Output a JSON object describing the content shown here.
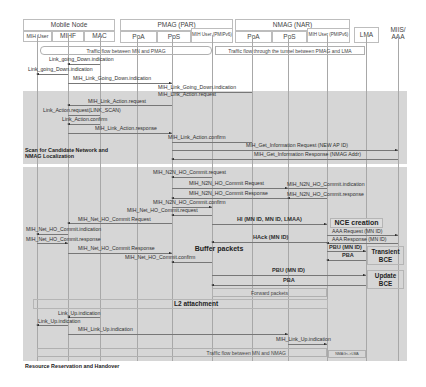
{
  "diagram": {
    "type": "message-sequence-chart",
    "header": {
      "groups": [
        {
          "label": "Mobile Node"
        },
        {
          "label": "PMAG (PAR)"
        },
        {
          "label": "NMAG (NAR)"
        }
      ],
      "entities": [
        {
          "label": "MIH User"
        },
        {
          "label": "MIHF"
        },
        {
          "label": "MAC"
        },
        {
          "label": "PoA"
        },
        {
          "label": "PoS"
        },
        {
          "label": "MIH User (PMIPv6)"
        },
        {
          "label": "PoA"
        },
        {
          "label": "PoS"
        },
        {
          "label": "MIH User (PMIPv6)"
        },
        {
          "label": "LMA"
        },
        {
          "label": "MIIS/ AAA"
        }
      ]
    },
    "flows": {
      "top_left": "Traffic flow between MN and PMAG",
      "top_right": "Traffic flow through the tunnel between PMAG and LMA",
      "forward": "Forward packets",
      "bottom": "Traffic flow between MN and NMAG",
      "bottom_right": "NMAG<->LMA"
    },
    "phases": [
      {
        "label": "Scan for Candidate Network and NMAG Localization"
      },
      {
        "label": "Resource Reservation and Handover"
      }
    ],
    "messages": [
      "Link_going_Down.indication",
      "Link_going_Down.indication",
      "MIH_Link_Going_Down.indication",
      "MIH_Link_Going_Down.indication",
      "MIH_Link_Action.request",
      "MIH_Link_Action.request",
      "Link_Action.request(LINK_SCAN)",
      "Link_Action.confirm",
      "MIH_Link_Action.response",
      "MIH_Link_Action.confirm",
      "MIH_Get_Information Request (NEW AP ID)",
      "MIH_Get_Information Response (NMAG Addr)",
      "MIH_N2N_HO_Commit.request",
      "MIH_N2N_HO_Commit Request",
      "MIH_N2N_HO_Commit.indication",
      "MIH_N2N_HO_Commit Response",
      "MIH_N2N_HO_Commit.response",
      "MIH_N2N_HO_Commit.confirm",
      "MIH_Net_HO_Commit.request",
      "MIH_Net_HO_Commit Request",
      "HI (MN ID, MN ID, LMAA)",
      "MIH_Net_HO_Commit.indication",
      "AAA Request (MN ID)",
      "HAck (MN ID)",
      "AAA Response (MN ID)",
      "MIH_Net_HO_Commit.response",
      "MIH_Net_HO_Commit Response",
      "PBU (MN ID)",
      "PBA",
      "MIH_Net_HO_Commit.confirm",
      "PBU (MN ID)",
      "PBA",
      "Link_Up.indication",
      "Link_Up.indication",
      "MIH_Link_Up.indication",
      "MIH_Link_Up.indication"
    ],
    "actions": {
      "nce": "NCE creation",
      "buffer": "Buffer packets",
      "transient": "Transient BCE",
      "update": "Update BCE",
      "l2": "L2 attachment"
    }
  }
}
